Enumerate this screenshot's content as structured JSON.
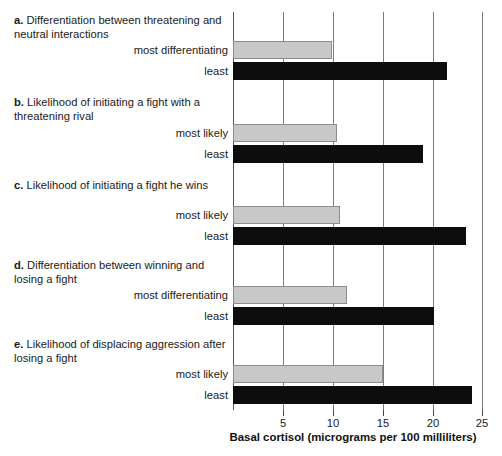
{
  "chart_data": {
    "type": "bar",
    "orientation": "horizontal",
    "title": "",
    "xlabel": "Basal cortisol (micrograms per 100 milliliters)",
    "ylabel": "",
    "xlim": [
      0,
      25
    ],
    "xticks": [
      5,
      10,
      15,
      20,
      25
    ],
    "xticklabels": [
      "5",
      "10",
      "15",
      "20",
      "25"
    ],
    "grid": true,
    "grid_axis": "x",
    "legend": "none",
    "colors": {
      "high_rank_bar": "#c8c8c8",
      "low_rank_bar": "#0d0d0d",
      "gridline": "#7d7d7d",
      "axis": "#444444",
      "text": "#1a1a1a"
    },
    "panels": [
      {
        "letter": "a.",
        "caption": "Differentiation between threatening and neutral interactions",
        "categories": [
          "most differentiating",
          "least"
        ],
        "values": [
          9.9,
          21.4
        ],
        "bar_styles": [
          "gray",
          "black"
        ]
      },
      {
        "letter": "b.",
        "caption": "Likelihood of initiating a fight with a threatening rival",
        "categories": [
          "most likely",
          "least"
        ],
        "values": [
          10.4,
          19.0
        ],
        "bar_styles": [
          "gray",
          "black"
        ]
      },
      {
        "letter": "c.",
        "caption": "Likelihood of initiating a fight he wins",
        "categories": [
          "most likely",
          "least"
        ],
        "values": [
          10.7,
          23.3
        ],
        "bar_styles": [
          "gray",
          "black"
        ]
      },
      {
        "letter": "d.",
        "caption": "Differentiation between winning and losing a fight",
        "categories": [
          "most differentiating",
          "least"
        ],
        "values": [
          11.4,
          20.1
        ],
        "bar_styles": [
          "gray",
          "black"
        ]
      },
      {
        "letter": "e.",
        "caption": "Likelihood of displacing aggression after losing a fight",
        "categories": [
          "most likely",
          "least"
        ],
        "values": [
          15.0,
          23.9
        ],
        "bar_styles": [
          "gray",
          "black"
        ]
      }
    ]
  }
}
